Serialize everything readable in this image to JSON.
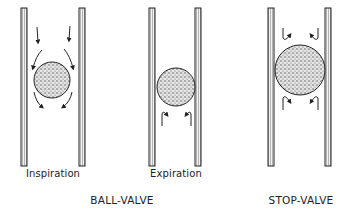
{
  "diagram": {
    "panels": [
      {
        "id": "inspiration",
        "label": "Inspiration",
        "flow": "air flows downward around ball (valve open)"
      },
      {
        "id": "expiration",
        "label": "Expiration",
        "flow": "air pushes upward, ball seals tube (valve closed)"
      },
      {
        "id": "stop-valve",
        "label": "",
        "flow": "ball wedged in tube, air blocked in both directions"
      }
    ],
    "group_titles": {
      "ball_valve": "BALL-VALVE",
      "stop_valve": "STOP-VALVE"
    },
    "colors": {
      "ink": "#222222",
      "tube_fill": "#d8d8d8",
      "ball_fill": "#9a9a9a"
    }
  }
}
